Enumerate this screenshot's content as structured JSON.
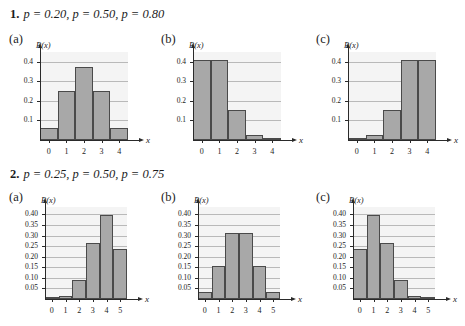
{
  "page": {
    "background_color": "#ffffff",
    "bar_fill_color": "#a8a8a8",
    "bar_edge_color": "#4a4a4a",
    "plot_background_color": "#f4f4f4",
    "gridline_color": "#b9b9b9",
    "axis_color": "#2a2a2a"
  },
  "problems": [
    {
      "number": "1.",
      "heading": "p = 0.20, p = 0.50, p = 0.80",
      "panels": [
        {
          "tag": "(a)",
          "chart_data": {
            "type": "bar",
            "title": "",
            "xlabel": "x",
            "ylabel": "P(x)",
            "categories": [
              "0",
              "1",
              "2",
              "3",
              "4"
            ],
            "values": [
              0.0625,
              0.25,
              0.375,
              0.25,
              0.0625
            ],
            "yticks": [
              0.1,
              0.2,
              0.3,
              0.4
            ],
            "ytick_labels": [
              "0.1",
              "0.2",
              "0.3",
              "0.4"
            ],
            "ylim": [
              0,
              0.45
            ],
            "grid": true,
            "legend": "none"
          }
        },
        {
          "tag": "(b)",
          "chart_data": {
            "type": "bar",
            "title": "",
            "xlabel": "x",
            "ylabel": "P(x)",
            "categories": [
              "0",
              "1",
              "2",
              "3",
              "4"
            ],
            "values": [
              0.41,
              0.41,
              0.154,
              0.026,
              0.002
            ],
            "yticks": [
              0.1,
              0.2,
              0.3,
              0.4
            ],
            "ytick_labels": [
              "0.1",
              "0.2",
              "0.3",
              "0.4"
            ],
            "ylim": [
              0,
              0.45
            ],
            "grid": true,
            "legend": "none"
          }
        },
        {
          "tag": "(c)",
          "chart_data": {
            "type": "bar",
            "title": "",
            "xlabel": "x",
            "ylabel": "P(x)",
            "categories": [
              "0",
              "1",
              "2",
              "3",
              "4"
            ],
            "values": [
              0.002,
              0.026,
              0.154,
              0.41,
              0.41
            ],
            "yticks": [
              0.1,
              0.2,
              0.3,
              0.4
            ],
            "ytick_labels": [
              "0.1",
              "0.2",
              "0.3",
              "0.4"
            ],
            "ylim": [
              0,
              0.45
            ],
            "grid": true,
            "legend": "none"
          }
        }
      ]
    },
    {
      "number": "2.",
      "heading": "p = 0.25, p = 0.50, p = 0.75",
      "panels": [
        {
          "tag": "(a)",
          "chart_data": {
            "type": "bar",
            "title": "",
            "xlabel": "x",
            "ylabel": "P(x)",
            "categories": [
              "0",
              "1",
              "2",
              "3",
              "4",
              "5"
            ],
            "values": [
              0.001,
              0.015,
              0.088,
              0.264,
              0.396,
              0.237
            ],
            "yticks": [
              0.05,
              0.1,
              0.15,
              0.2,
              0.25,
              0.3,
              0.35,
              0.4
            ],
            "ytick_labels": [
              "0.05",
              "0.10",
              "0.15",
              "0.20",
              "0.25",
              "0.30",
              "0.35",
              "0.40"
            ],
            "ylim": [
              0,
              0.435
            ],
            "grid": true,
            "legend": "none"
          }
        },
        {
          "tag": "(b)",
          "chart_data": {
            "type": "bar",
            "title": "",
            "xlabel": "x",
            "ylabel": "P(x)",
            "categories": [
              "0",
              "1",
              "2",
              "3",
              "4",
              "5"
            ],
            "values": [
              0.031,
              0.156,
              0.313,
              0.313,
              0.156,
              0.031
            ],
            "yticks": [
              0.05,
              0.1,
              0.15,
              0.2,
              0.25,
              0.3,
              0.35,
              0.4
            ],
            "ytick_labels": [
              "0.05",
              "0.10",
              "0.15",
              "0.20",
              "0.25",
              "0.30",
              "0.35",
              "0.40"
            ],
            "ylim": [
              0,
              0.435
            ],
            "grid": true,
            "legend": "none"
          }
        },
        {
          "tag": "(c)",
          "chart_data": {
            "type": "bar",
            "title": "",
            "xlabel": "x",
            "ylabel": "P(x)",
            "categories": [
              "0",
              "1",
              "2",
              "3",
              "4",
              "5"
            ],
            "values": [
              0.237,
              0.396,
              0.264,
              0.088,
              0.015,
              0.001
            ],
            "yticks": [
              0.05,
              0.1,
              0.15,
              0.2,
              0.25,
              0.3,
              0.35,
              0.4
            ],
            "ytick_labels": [
              "0.05",
              "0.10",
              "0.15",
              "0.20",
              "0.25",
              "0.30",
              "0.35",
              "0.40"
            ],
            "ylim": [
              0,
              0.435
            ],
            "grid": true,
            "legend": "none"
          }
        }
      ]
    }
  ]
}
